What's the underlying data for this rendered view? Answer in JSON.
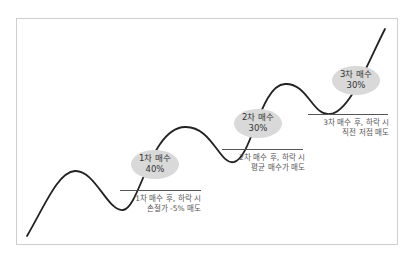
{
  "diagram": {
    "type": "staged-buy-strategy",
    "colors": {
      "curve": "#222222",
      "bubble": "#d9d9d9",
      "level_line": "#555555",
      "frame_border": "#cfcfcf",
      "text": "#333333"
    },
    "stages": [
      {
        "title": "1차 매수",
        "percent": "40%",
        "caption_line1": "1차 매수 후, 하락 시",
        "caption_line2": "손절가 -5% 매도"
      },
      {
        "title": "2차 매수",
        "percent": "30%",
        "caption_line1": "2차 매수 후, 하락 시",
        "caption_line2": "평균 매수가 매도"
      },
      {
        "title": "3차 매수",
        "percent": "30%",
        "caption_line1": "3차 매수 후, 하락 시",
        "caption_line2": "직전 저점 매도"
      }
    ]
  }
}
